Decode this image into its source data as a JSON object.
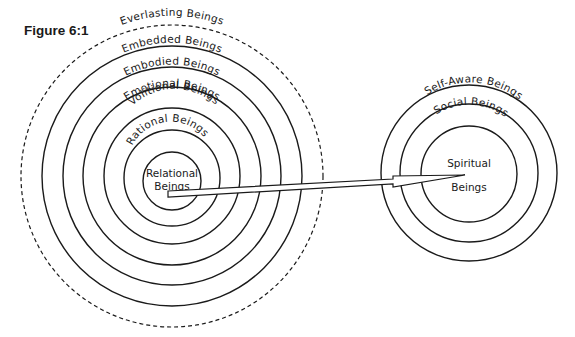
{
  "figure": {
    "title": "Figure 6:1",
    "left_diagram": {
      "outer_dashed_label": "Everlasting Beings",
      "rings": [
        "Embedded Beings",
        "Embodied Beings",
        "Emotional Beings",
        "Volitional Beings",
        "Rational Beings"
      ],
      "center": {
        "line1": "Relational",
        "line2": "Beings"
      }
    },
    "right_diagram": {
      "rings": [
        "Self-Aware Beings",
        "Social Beings"
      ],
      "center": {
        "line1": "Spiritual",
        "line2": "Beings"
      }
    },
    "arrow": {
      "from": "Relational Beings",
      "to": "Spiritual Beings"
    },
    "colors": {
      "line": "#1a1a1a",
      "background": "#ffffff"
    }
  }
}
